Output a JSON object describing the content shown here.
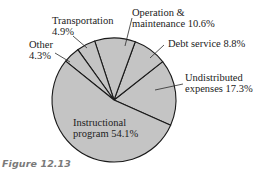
{
  "chart_data": {
    "type": "pie",
    "title": "",
    "caption": "Figure 12.13",
    "categories": [
      "Instructional program",
      "Undistributed expenses",
      "Debt service",
      "Operation & maintenance",
      "Transportation",
      "Other"
    ],
    "values": [
      54.1,
      17.3,
      8.8,
      10.6,
      4.9,
      4.3
    ],
    "unit": "%",
    "slice_fill": "#c4c4c4",
    "slice_stroke": "#1a1a1a",
    "labels": {
      "transportation": {
        "line1": "Transportation",
        "line2": "4.9%"
      },
      "other": {
        "line1": "Other",
        "line2": "4.3%"
      },
      "operation": {
        "line1": "Operation &",
        "line2": "maintenance 10.6%"
      },
      "debt": {
        "line1": "Debt service 8.8%"
      },
      "undistributed": {
        "line1": "Undistributed",
        "line2": "expenses 17.3%"
      },
      "instructional": {
        "line1": "Instructional",
        "line2": "program 54.1%"
      }
    }
  }
}
